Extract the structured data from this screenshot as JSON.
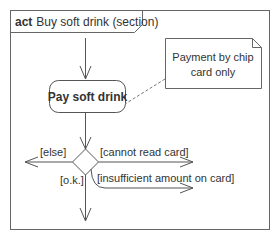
{
  "diagram": {
    "type": "uml-activity",
    "frame": {
      "keyword": "act",
      "title": "Buy soft drink (section)"
    },
    "action": {
      "label": "Pay soft drink"
    },
    "note": {
      "line1": "Payment by chip",
      "line2": "card only"
    },
    "guards": {
      "else": "[else]",
      "cannot_read": "[cannot read card]",
      "ok": "[o.k.]",
      "insufficient": "[insufficient amount on card]"
    },
    "colors": {
      "stroke": "#555555",
      "text": "#333333",
      "background": "#ffffff"
    }
  }
}
